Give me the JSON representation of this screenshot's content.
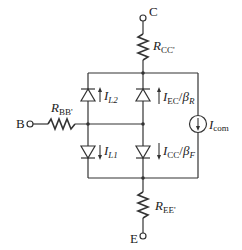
{
  "diagram": {
    "type": "circuit-schematic",
    "terminals": {
      "collector": "C",
      "base": "B",
      "emitter": "E"
    },
    "resistors": {
      "collector": {
        "main": "R",
        "sub": "CC'"
      },
      "base": {
        "main": "R",
        "sub": "BB'"
      },
      "emitter": {
        "main": "R",
        "sub": "EE'"
      }
    },
    "diodes": {
      "leak2": {
        "main": "I",
        "sub": "L2",
        "direction": "up"
      },
      "reverse": {
        "main": "I",
        "sub": "EC",
        "div": "/",
        "beta": "β",
        "beta_sub": "R",
        "direction": "up"
      },
      "leak1": {
        "main": "I",
        "sub": "L1",
        "direction": "down"
      },
      "forward": {
        "main": "I",
        "sub": "CC",
        "div": "/",
        "beta": "β",
        "beta_sub": "F",
        "direction": "down"
      }
    },
    "current_source": {
      "main": "I",
      "sub": "com",
      "direction": "down"
    },
    "colors": {
      "line": "#333333",
      "background": "#ffffff"
    }
  }
}
